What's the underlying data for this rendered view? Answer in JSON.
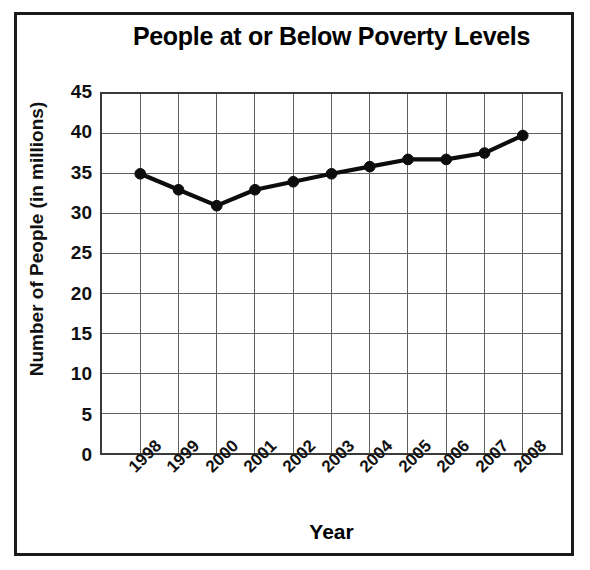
{
  "chart_data": {
    "type": "line",
    "title": "People at or Below Poverty Levels",
    "xlabel": "Year",
    "ylabel": "Number of People (in millions)",
    "categories": [
      "1998",
      "1999",
      "2000",
      "2001",
      "2002",
      "2003",
      "2004",
      "2005",
      "2006",
      "2007",
      "2008"
    ],
    "values": [
      35.0,
      33.0,
      31.0,
      33.0,
      34.0,
      35.0,
      35.9,
      36.8,
      36.8,
      37.6,
      39.8
    ],
    "ylim": [
      0,
      45
    ],
    "ytick_step": 5,
    "yticks": [
      "45",
      "40",
      "35",
      "30",
      "25",
      "20",
      "15",
      "10",
      "5",
      "0"
    ],
    "grid": "both",
    "legend": "none",
    "series_color": "#0d0d0d",
    "grid_color": "#5d5d5d",
    "axis_color": "#3a3a3a",
    "marker": "circle"
  },
  "frame": {
    "border_color": "#1a1a1a"
  }
}
